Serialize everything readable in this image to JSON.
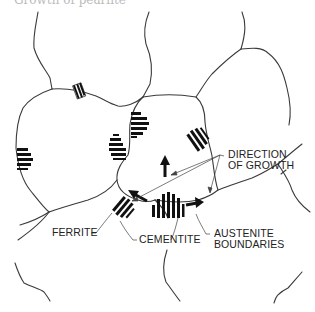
{
  "figure": {
    "caption_fragment": "Growth of pearlite",
    "labels": {
      "direction_of_growth": [
        "DIRECTION",
        "OF GROWTH"
      ],
      "ferrite": "FERRITE",
      "cementite": "CEMENTITE",
      "austenite_boundaries": [
        "AUSTENITE",
        "BOUNDARIES"
      ]
    },
    "colors": {
      "boundary_line": "#3a3a3a",
      "lamellae": "#111111",
      "leader_line": "#444444",
      "background": "#ffffff"
    },
    "elements": {
      "pearlite_nodules": 7,
      "growth_arrows": 3
    }
  }
}
